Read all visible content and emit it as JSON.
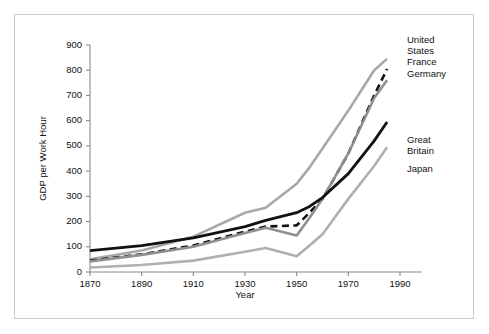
{
  "chart_data": {
    "type": "line",
    "title": "",
    "xlabel": "Year",
    "ylabel": "GDP per Work Hour",
    "xlim": [
      1870,
      1990
    ],
    "ylim": [
      0,
      900
    ],
    "xticks": [
      1870,
      1890,
      1910,
      1930,
      1950,
      1970,
      1990
    ],
    "yticks": [
      0,
      100,
      200,
      300,
      400,
      500,
      600,
      700,
      800,
      900
    ],
    "grid": false,
    "legend_position": "right-of-line-ends",
    "x": [
      1870,
      1890,
      1910,
      1930,
      1938,
      1950,
      1955,
      1960,
      1970,
      1980,
      1985
    ],
    "series": [
      {
        "name": "United States",
        "style": "solid",
        "color": "#a8a8a8",
        "width": 2.6,
        "values": [
          50,
          85,
          140,
          235,
          255,
          350,
          415,
          490,
          640,
          800,
          845
        ]
      },
      {
        "name": "France",
        "style": "dashed",
        "color": "#111111",
        "width": 2.6,
        "values": [
          45,
          70,
          105,
          160,
          180,
          185,
          235,
          290,
          470,
          700,
          805
        ]
      },
      {
        "name": "Germany",
        "style": "solid",
        "color": "#8f8f8f",
        "width": 2.6,
        "values": [
          42,
          68,
          100,
          155,
          175,
          145,
          215,
          290,
          470,
          690,
          760
        ]
      },
      {
        "name": "Great Britain",
        "style": "solid",
        "color": "#111111",
        "width": 2.8,
        "values": [
          85,
          105,
          135,
          180,
          205,
          235,
          260,
          295,
          390,
          520,
          595
        ]
      },
      {
        "name": "Japan",
        "style": "solid",
        "color": "#b0b0b0",
        "width": 2.6,
        "values": [
          18,
          28,
          45,
          80,
          95,
          62,
          105,
          150,
          290,
          420,
          495
        ]
      }
    ],
    "series_labels": [
      {
        "text": "United States",
        "multiline": [
          "United",
          "States"
        ],
        "value_at_end": 845
      },
      {
        "text": "France",
        "multiline": [
          "France"
        ],
        "value_at_end": 805
      },
      {
        "text": "Germany",
        "multiline": [
          "Germany"
        ],
        "value_at_end": 760
      },
      {
        "text": "Great Britain",
        "multiline": [
          "Great",
          "Britain"
        ],
        "value_at_end": 595
      },
      {
        "text": "Japan",
        "multiline": [
          "Japan"
        ],
        "value_at_end": 495
      }
    ]
  },
  "labels": {
    "y_axis_title": "GDP per Work Hour",
    "x_axis_title": "Year",
    "yticks": [
      "0",
      "100",
      "200",
      "300",
      "400",
      "500",
      "600",
      "700",
      "800",
      "900"
    ],
    "xticks": [
      "1870",
      "1890",
      "1910",
      "1930",
      "1950",
      "1970",
      "1990"
    ],
    "legend": {
      "united_states_l1": "United",
      "united_states_l2": "States",
      "france": "France",
      "germany": "Germany",
      "great_britain_l1": "Great",
      "great_britain_l2": "Britain",
      "japan": "Japan"
    }
  },
  "colors": {
    "background": "#ffffff",
    "frame": "#c9c9c9",
    "axis": "#8a8a8a",
    "text": "#111111",
    "series_black": "#111111",
    "series_gray": "#a8a8a8"
  }
}
